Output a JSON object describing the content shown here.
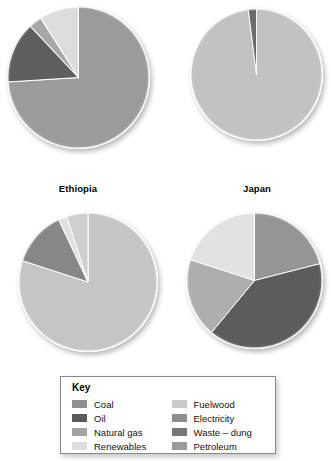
{
  "figure": {
    "background": "#ffffff",
    "charts": [
      {
        "id": "ethiopia",
        "title": "Ethiopia",
        "position": {
          "left": 7,
          "top": 6,
          "size": 143
        }
      },
      {
        "id": "japan",
        "title": "Japan",
        "position": {
          "left": 190,
          "top": 6,
          "size": 133
        }
      },
      {
        "id": "pie-bottom-left",
        "title": "",
        "position": {
          "left": 18,
          "top": 212,
          "size": 140
        }
      },
      {
        "id": "pie-bottom-right",
        "title": "",
        "position": {
          "left": 186,
          "top": 212,
          "size": 137
        }
      }
    ]
  },
  "legend": {
    "title": "Key",
    "columns": [
      {
        "items": [
          {
            "label": "Coal",
            "color": "#8f8f8f"
          },
          {
            "label": "Oil",
            "color": "#5a5a5a"
          },
          {
            "label": "Natural gas",
            "color": "#a3a3a3"
          },
          {
            "label": "Renewables",
            "color": "#dedede"
          }
        ]
      },
      {
        "items": [
          {
            "label": "Fuelwood",
            "color": "#c9c9c9"
          },
          {
            "label": "Electricity",
            "color": "#8f8f8f"
          },
          {
            "label": "Waste – dung",
            "color": "#767676"
          },
          {
            "label": "Petroleum",
            "color": "#9a9a9a"
          }
        ]
      }
    ]
  },
  "chart_data": {
    "type": "pie",
    "legend_position": "bottom-center",
    "legend_title": "Key",
    "categories": [
      "Coal",
      "Oil",
      "Natural gas",
      "Renewables",
      "Fuelwood",
      "Electricity",
      "Waste – dung",
      "Petroleum"
    ],
    "category_colors": {
      "Coal": "#8f8f8f",
      "Oil": "#5a5a5a",
      "Natural gas": "#a3a3a3",
      "Renewables": "#dedede",
      "Fuelwood": "#c9c9c9",
      "Electricity": "#8f8f8f",
      "Waste – dung": "#767676",
      "Petroleum": "#9a9a9a"
    },
    "charts": [
      {
        "id": "ethiopia",
        "title": "Ethiopia",
        "units": "percent",
        "start_angle": 0,
        "direction": "clockwise",
        "slices": [
          {
            "label": "Fuelwood",
            "value": 74,
            "color": "#9b9b9b"
          },
          {
            "label": "Waste – dung",
            "value": 14,
            "color": "#5e5e5e"
          },
          {
            "label": "Coal",
            "value": 3,
            "color": "#a8a8a8"
          },
          {
            "label": "Petroleum",
            "value": 9,
            "color": "#dcdcdc"
          }
        ]
      },
      {
        "id": "japan",
        "title": "Japan",
        "units": "percent",
        "start_angle": 0,
        "direction": "clockwise",
        "slices": [
          {
            "label": "Commercial energy",
            "value": 98,
            "color": "#c2c2c2"
          },
          {
            "label": "Waste – dung",
            "value": 2,
            "color": "#6b6b6b"
          }
        ]
      },
      {
        "id": "pie-bottom-left",
        "title": "",
        "units": "percent",
        "start_angle": 0,
        "direction": "clockwise",
        "slices": [
          {
            "label": "Fuelwood",
            "value": 80,
            "color": "#c5c5c5"
          },
          {
            "label": "Electricity",
            "value": 13,
            "color": "#878787"
          },
          {
            "label": "Renewables",
            "value": 2,
            "color": "#e0e0e0"
          },
          {
            "label": "Natural gas",
            "value": 5,
            "color": "#cfcfcf"
          }
        ]
      },
      {
        "id": "pie-bottom-right",
        "title": "",
        "units": "percent",
        "start_angle": 0,
        "direction": "clockwise",
        "slices": [
          {
            "label": "Coal",
            "value": 21,
            "color": "#959595"
          },
          {
            "label": "Oil",
            "value": 40,
            "color": "#5c5c5c"
          },
          {
            "label": "Natural gas",
            "value": 19,
            "color": "#aeaeae"
          },
          {
            "label": "Renewables",
            "value": 20,
            "color": "#e2e2e2"
          }
        ]
      }
    ]
  }
}
